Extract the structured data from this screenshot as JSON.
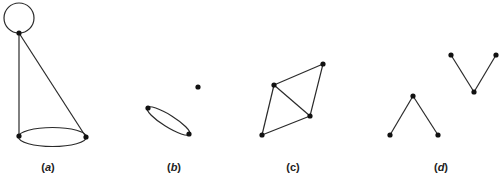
{
  "figure": {
    "panels": [
      {
        "id": "a",
        "label": "(a)",
        "label_letter": "a",
        "description": "Graph with a loop, two edges from top vertex, and a double edge between bottom vertices",
        "vertices": [
          [
            19,
            33
          ],
          [
            19,
            136
          ],
          [
            86,
            137
          ]
        ],
        "loop": {
          "cx": 19,
          "cy": 18,
          "r": 15
        },
        "edges": [
          [
            [
              19,
              33
            ],
            [
              19,
              136
            ]
          ],
          [
            [
              19,
              33
            ],
            [
              86,
              137
            ]
          ]
        ],
        "multi_edge_ellipse": {
          "cx": 52.5,
          "cy": 137,
          "rx": 34,
          "ry": 9.5
        }
      },
      {
        "id": "b",
        "label": "(b)",
        "label_letter": "b",
        "description": "Two vertices joined by a double edge plus an isolated vertex",
        "vertices": [
          [
            148,
            108
          ],
          [
            189,
            134
          ],
          [
            198,
            87
          ]
        ],
        "multi_edge_ellipse": {
          "cx": 168.5,
          "cy": 121,
          "rx": 25,
          "ry": 6,
          "rotate": 32
        }
      },
      {
        "id": "c",
        "label": "(c)",
        "label_letter": "c",
        "description": "Four vertices forming a quadrilateral with one diagonal",
        "vertices": [
          [
            323,
            64
          ],
          [
            274,
            85
          ],
          [
            310,
            116
          ],
          [
            262,
            135
          ]
        ],
        "edges": [
          [
            [
              274,
              85
            ],
            [
              323,
              64
            ]
          ],
          [
            [
              323,
              64
            ],
            [
              310,
              116
            ]
          ],
          [
            [
              274,
              85
            ],
            [
              310,
              116
            ]
          ],
          [
            [
              274,
              85
            ],
            [
              262,
              135
            ]
          ],
          [
            [
              262,
              135
            ],
            [
              310,
              116
            ]
          ]
        ]
      },
      {
        "id": "d",
        "label": "(d)",
        "label_letter": "d",
        "description": "Two disconnected paths of length two",
        "vertices": [
          [
            390,
            135
          ],
          [
            413,
            96
          ],
          [
            438,
            135
          ],
          [
            451,
            55
          ],
          [
            474,
            92
          ],
          [
            496,
            55
          ]
        ],
        "edges": [
          [
            [
              390,
              135
            ],
            [
              413,
              96
            ]
          ],
          [
            [
              413,
              96
            ],
            [
              438,
              135
            ]
          ],
          [
            [
              451,
              55
            ],
            [
              474,
              92
            ]
          ],
          [
            [
              474,
              92
            ],
            [
              496,
              55
            ]
          ]
        ]
      }
    ],
    "label_positions": {
      "a": [
        48,
        170
      ],
      "b": [
        174,
        170
      ],
      "c": [
        293,
        170
      ],
      "d": [
        441,
        170
      ]
    },
    "colors": {
      "edge": "#2a2a2a",
      "vertex": "#111111",
      "background": "#ffffff"
    }
  }
}
